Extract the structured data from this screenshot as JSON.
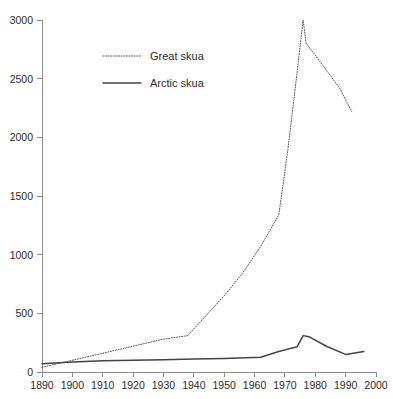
{
  "chart_data": {
    "type": "line",
    "title": "",
    "subtitle": "",
    "xlabel": "",
    "ylabel": "",
    "xlim": [
      1890,
      2000
    ],
    "ylim": [
      0,
      3000
    ],
    "grid": false,
    "legend_position": "top-left",
    "x_ticks": [
      1890,
      1900,
      1910,
      1920,
      1930,
      1940,
      1950,
      1960,
      1970,
      1980,
      1990,
      2000
    ],
    "x_tick_labels": [
      "1890",
      "1900",
      "1910",
      "1920",
      "1930",
      "1940",
      "1950",
      "1960",
      "1970",
      "1980",
      "1990",
      "2000"
    ],
    "y_ticks": [
      0,
      500,
      1000,
      1500,
      2000,
      2500,
      3000
    ],
    "y_tick_labels": [
      "0",
      "500",
      "1000",
      "1500",
      "2000",
      "2500",
      "3000"
    ],
    "series": [
      {
        "name": "Great skua",
        "style": "dotted",
        "color": "#555555",
        "x": [
          1890,
          1895,
          1900,
          1905,
          1910,
          1915,
          1920,
          1925,
          1930,
          1938,
          1944,
          1950,
          1956,
          1962,
          1968,
          1971,
          1974,
          1976,
          1977,
          1980,
          1984,
          1988,
          1992
        ],
        "y": [
          40,
          70,
          100,
          130,
          160,
          190,
          220,
          250,
          280,
          310,
          480,
          650,
          840,
          1070,
          1340,
          1900,
          2550,
          3000,
          2800,
          2700,
          2560,
          2420,
          2220
        ]
      },
      {
        "name": "Arctic skua",
        "style": "solid",
        "color": "#444444",
        "x": [
          1890,
          1900,
          1910,
          1920,
          1930,
          1940,
          1950,
          1962,
          1968,
          1974,
          1976,
          1978,
          1984,
          1990,
          1996
        ],
        "y": [
          70,
          85,
          95,
          100,
          105,
          110,
          115,
          125,
          175,
          215,
          310,
          300,
          215,
          150,
          175
        ]
      }
    ]
  },
  "legend": {
    "entries": [
      {
        "label": "Great skua"
      },
      {
        "label": "Arctic skua"
      }
    ]
  }
}
